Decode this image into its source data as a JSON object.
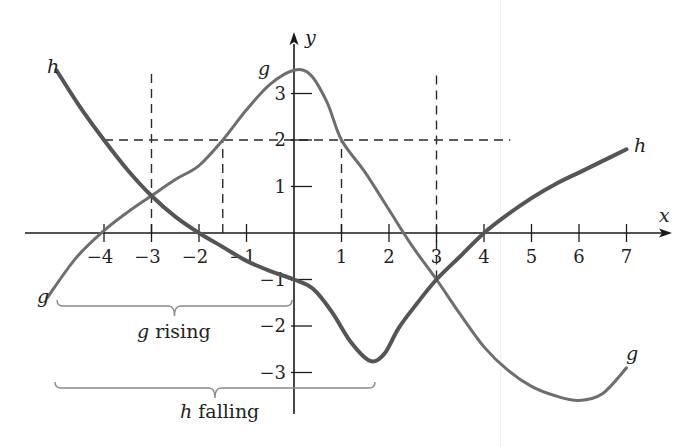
{
  "chart_data": {
    "type": "line",
    "title": "",
    "xlabel": "x",
    "ylabel": "y",
    "xlim": [
      -5.5,
      7.9
    ],
    "ylim": [
      -3.9,
      4.3
    ],
    "grid": false,
    "x_ticks": [
      -4,
      -3,
      -2,
      -1,
      1,
      2,
      3,
      4,
      5,
      6,
      7
    ],
    "x_tick_labels": [
      "−4",
      "−3",
      "−2",
      "−1",
      "1",
      "2",
      "3",
      "4",
      "5",
      "6",
      "7"
    ],
    "y_ticks": [
      3,
      2,
      1,
      -1,
      -2,
      -3
    ],
    "y_tick_labels": [
      "3",
      "2",
      "1",
      "−1",
      "−2",
      "−3"
    ],
    "series": [
      {
        "name": "g",
        "color": "#6e6e6e",
        "points": [
          [
            -5.2,
            -1.4
          ],
          [
            -4.6,
            -0.55
          ],
          [
            -4,
            0.05
          ],
          [
            -3.5,
            0.45
          ],
          [
            -3,
            0.8
          ],
          [
            -2.5,
            1.15
          ],
          [
            -2,
            1.45
          ],
          [
            -1.5,
            2
          ],
          [
            -1,
            2.65
          ],
          [
            -0.5,
            3.2
          ],
          [
            0,
            3.5
          ],
          [
            0.35,
            3.4
          ],
          [
            0.7,
            2.8
          ],
          [
            1,
            2
          ],
          [
            1.5,
            1.3
          ],
          [
            2,
            0.5
          ],
          [
            2.5,
            -0.3
          ],
          [
            3,
            -1
          ],
          [
            3.5,
            -1.75
          ],
          [
            4,
            -2.45
          ],
          [
            4.5,
            -2.95
          ],
          [
            5,
            -3.3
          ],
          [
            5.5,
            -3.5
          ],
          [
            6,
            -3.6
          ],
          [
            6.5,
            -3.45
          ],
          [
            7,
            -2.9
          ]
        ]
      },
      {
        "name": "h",
        "color": "#555555",
        "points": [
          [
            -5,
            3.5
          ],
          [
            -4.5,
            2.7
          ],
          [
            -4,
            2
          ],
          [
            -3.5,
            1.35
          ],
          [
            -3,
            0.8
          ],
          [
            -2.5,
            0.35
          ],
          [
            -2,
            0
          ],
          [
            -1.5,
            -0.3
          ],
          [
            -1,
            -0.6
          ],
          [
            -0.5,
            -0.82
          ],
          [
            0,
            -1
          ],
          [
            0.4,
            -1.2
          ],
          [
            0.8,
            -1.7
          ],
          [
            1.2,
            -2.35
          ],
          [
            1.6,
            -2.75
          ],
          [
            1.9,
            -2.6
          ],
          [
            2.2,
            -2.05
          ],
          [
            2.6,
            -1.5
          ],
          [
            3,
            -1
          ],
          [
            3.5,
            -0.5
          ],
          [
            4,
            0
          ],
          [
            4.5,
            0.4
          ],
          [
            5,
            0.75
          ],
          [
            5.5,
            1.05
          ],
          [
            6,
            1.3
          ],
          [
            6.5,
            1.55
          ],
          [
            7,
            1.8
          ]
        ]
      }
    ],
    "reference_lines": {
      "horizontal_dashed": {
        "y": 2,
        "x_from": -4,
        "x_to": 4.3
      },
      "vertical_dashed": [
        {
          "x": -3,
          "y_from": 0,
          "y_to": 3.5
        },
        {
          "x": -1.5,
          "y_from": 0,
          "y_to": 2
        },
        {
          "x": 1,
          "y_from": 0,
          "y_to": 2
        },
        {
          "x": 3,
          "y_from": -1,
          "y_to": 3.5
        }
      ]
    },
    "annotations": [
      {
        "text": "g rising",
        "type": "brace",
        "x_from": -5.2,
        "x_to": 0,
        "y": -1.65
      },
      {
        "text": "h falling",
        "type": "brace",
        "x_from": -5.2,
        "x_to": 1.7,
        "y": -3.4
      }
    ],
    "curve_labels": [
      {
        "text": "h",
        "x": -5.1,
        "y": 3.7
      },
      {
        "text": "g",
        "x": -0.6,
        "y": 3.5
      },
      {
        "text": "h",
        "x": 7.2,
        "y": 1.8
      },
      {
        "text": "g",
        "x": -5.5,
        "y": -1.4
      },
      {
        "text": "g",
        "x": 7.0,
        "y": -2.6
      }
    ]
  },
  "labels": {
    "x_axis": "x",
    "y_axis": "y",
    "curve_g": "g",
    "curve_h": "h",
    "brace_g": {
      "var": "g",
      "word": " rising"
    },
    "brace_h": {
      "var": "h",
      "word": " falling"
    }
  }
}
